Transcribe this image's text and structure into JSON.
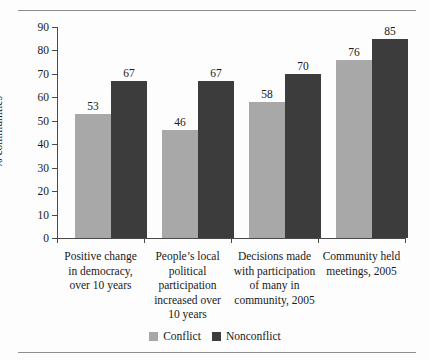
{
  "chart_data": {
    "type": "bar",
    "title": "",
    "subtitle": "",
    "xlabel": "",
    "ylabel": "% communities",
    "ylim": [
      0,
      90
    ],
    "ytick_step": 10,
    "yticks": [
      90,
      80,
      70,
      60,
      50,
      40,
      30,
      20,
      10,
      0
    ],
    "grid": false,
    "legend_position": "bottom-center",
    "categories": [
      "Positive change in democracy, over 10 years",
      "People’s local political participation increased over 10 years",
      "Decisions made with participation of many in community, 2005",
      "Community held meetings, 2005"
    ],
    "category_lines": [
      [
        "Positive change",
        "in democracy,",
        "over 10 years"
      ],
      [
        "People’s local",
        "political",
        "participation",
        "increased over",
        "10 years"
      ],
      [
        "Decisions made",
        "with participation",
        "of many in",
        "community, 2005"
      ],
      [
        "Community held",
        "meetings, 2005"
      ]
    ],
    "series": [
      {
        "name": "Conflict",
        "color": "#a8a8a8",
        "values": [
          53,
          46,
          58,
          76
        ]
      },
      {
        "name": "Nonconflict",
        "color": "#3c3c3c",
        "values": [
          67,
          67,
          70,
          85
        ]
      }
    ]
  },
  "legend": {
    "items": [
      {
        "label": "Conflict",
        "color": "#a8a8a8"
      },
      {
        "label": "Nonconflict",
        "color": "#3c3c3c"
      }
    ]
  }
}
